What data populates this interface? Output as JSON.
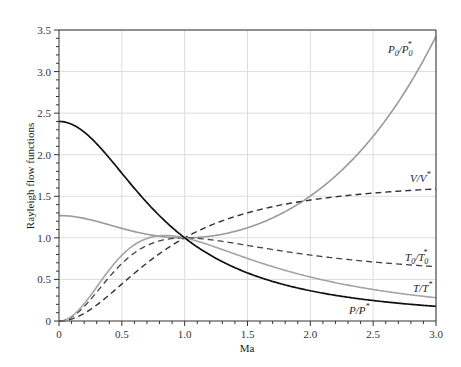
{
  "chart_data": {
    "type": "line",
    "title": "",
    "xlabel": "Ma",
    "ylabel": "Rayleigh flow functions",
    "xlim": [
      0,
      3.0
    ],
    "ylim": [
      0,
      3.5
    ],
    "xticks": [
      "0",
      "0.5",
      "1.0",
      "1.5",
      "2.0",
      "2.5",
      "3.0"
    ],
    "yticks": [
      "0",
      "0.5",
      "1.0",
      "1.5",
      "2.0",
      "2.5",
      "3.0",
      "3.5"
    ],
    "grid": true,
    "legend": "inline labels at right",
    "x": [
      0,
      0.25,
      0.5,
      0.75,
      1.0,
      1.25,
      1.5,
      1.75,
      2.0,
      2.25,
      2.5,
      2.75,
      3.0
    ],
    "series": [
      {
        "name": "P0/P0*",
        "style": "solid gray",
        "values": [
          1.268,
          1.215,
          1.114,
          1.03,
          1.0,
          1.026,
          1.122,
          1.294,
          1.503,
          1.799,
          2.222,
          2.743,
          3.424
        ]
      },
      {
        "name": "V/V*",
        "style": "dashed dark",
        "values": [
          0,
          0.193,
          0.632,
          0.813,
          1.0,
          1.179,
          1.314,
          1.413,
          1.455,
          1.505,
          1.54,
          1.565,
          1.583
        ]
      },
      {
        "name": "T0/T0*",
        "style": "dashed dark",
        "values": [
          0,
          0.225,
          0.691,
          0.952,
          1.0,
          0.968,
          0.909,
          0.857,
          0.794,
          0.761,
          0.735,
          0.715,
          0.654
        ]
      },
      {
        "name": "T/T*",
        "style": "solid gray",
        "values": [
          0,
          0.237,
          0.79,
          0.99,
          1.0,
          0.907,
          0.753,
          0.625,
          0.529,
          0.439,
          0.369,
          0.314,
          0.28
        ]
      },
      {
        "name": "P/P*",
        "style": "solid black",
        "values": [
          2.4,
          2.207,
          1.778,
          1.326,
          1.0,
          0.75,
          0.578,
          0.456,
          0.364,
          0.296,
          0.246,
          0.207,
          0.176
        ]
      }
    ],
    "labels": {
      "p0": {
        "main": "P",
        "sub": "0",
        "sep": "/P",
        "sub2": "0",
        "sup": "*"
      },
      "v": "V/V",
      "t0": "T",
      "t": "T/T",
      "p": "P/P"
    }
  }
}
